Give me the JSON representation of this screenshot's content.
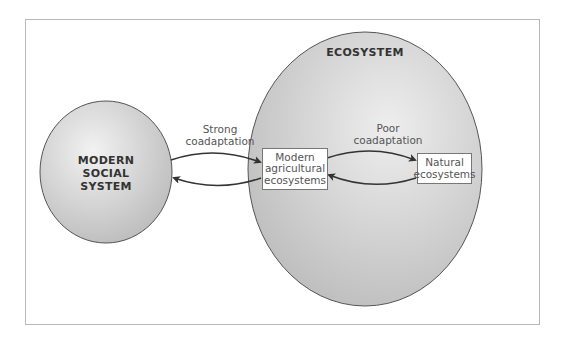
{
  "diagram": {
    "nodes": {
      "social_system": {
        "label_lines": [
          "MODERN",
          "SOCIAL",
          "SYSTEM"
        ]
      },
      "ecosystem": {
        "label": "ECOSYSTEM"
      },
      "agricultural": {
        "label_lines": [
          "Modern",
          "agricultural",
          "ecosystems"
        ]
      },
      "natural": {
        "label_lines": [
          "Natural",
          "ecosystems"
        ]
      }
    },
    "edges": {
      "strong": {
        "label_lines": [
          "Strong",
          "coadaptation"
        ],
        "from": "social_system",
        "to": "agricultural",
        "bidirectional": true
      },
      "poor": {
        "label_lines": [
          "Poor",
          "coadaptation"
        ],
        "from": "agricultural",
        "to": "natural",
        "bidirectional": true
      }
    },
    "colors": {
      "circle_fill_light": "#eeeeee",
      "circle_fill_dark": "#bdbdbd",
      "circle_stroke": "#555555",
      "arrow": "#333333",
      "frame_border": "#b8b8b8"
    }
  }
}
